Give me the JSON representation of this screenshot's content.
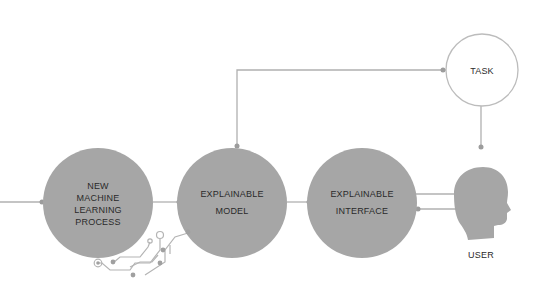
{
  "colors": {
    "node_fill": "#a6a6a6",
    "line": "#b0b0b0",
    "dot": "#9c9c9c",
    "task_stroke": "#bcbcbc",
    "text": "#2a2a2a",
    "background": "#ffffff"
  },
  "nodes": [
    {
      "id": "new-ml-process",
      "label": "NEW\nMACHINE\nLEARNING\nPROCESS",
      "shape": "filled-circle"
    },
    {
      "id": "explainable-model",
      "label": "EXPLAINABLE\nMODEL",
      "shape": "filled-circle"
    },
    {
      "id": "explainable-interface",
      "label": "EXPLAINABLE\nINTERFACE",
      "shape": "filled-circle"
    },
    {
      "id": "task",
      "label": "TASK",
      "shape": "outline-circle"
    },
    {
      "id": "user",
      "label": "USER",
      "shape": "head-icon"
    }
  ],
  "edges": [
    {
      "from": "input",
      "to": "new-ml-process"
    },
    {
      "from": "new-ml-process",
      "to": "explainable-model"
    },
    {
      "from": "explainable-model",
      "to": "explainable-interface"
    },
    {
      "from": "explainable-interface",
      "to": "user",
      "direction": "to-user"
    },
    {
      "from": "user",
      "to": "explainable-interface",
      "direction": "to-interface"
    },
    {
      "from": "task",
      "to": "explainable-model"
    },
    {
      "from": "task",
      "to": "user"
    }
  ]
}
